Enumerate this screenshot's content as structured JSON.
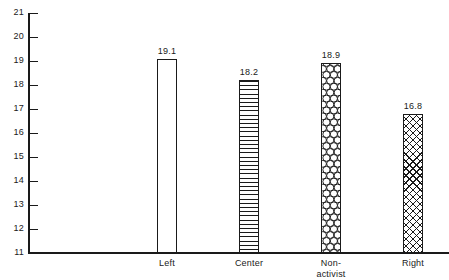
{
  "chart_data": {
    "type": "bar",
    "title": "",
    "subtitle": "",
    "xlabel": "",
    "ylabel": "",
    "categories": [
      "Left",
      "Center",
      "Non-activist",
      "Right"
    ],
    "values": [
      19.1,
      18.2,
      18.9,
      16.8
    ],
    "value_labels": [
      "19.1",
      "18.2",
      "18.9",
      "16.8"
    ],
    "bar_fills": [
      "empty",
      "horizontal-lines",
      "circles",
      "crosshatch"
    ],
    "ylim": [
      11,
      21
    ],
    "ytick_labels": [
      "11",
      "12",
      "13",
      "14",
      "15",
      "16",
      "17",
      "18",
      "19",
      "20",
      "21"
    ],
    "ytick_values": [
      11,
      12,
      13,
      14,
      15,
      16,
      17,
      18,
      19,
      20,
      21
    ],
    "grid": false,
    "legend": "none",
    "axis_color": "#1a1a1a",
    "background_color": "#ffffff"
  },
  "category_label_lines": [
    [
      "Left"
    ],
    [
      "Center"
    ],
    [
      "Non-",
      "activist"
    ],
    [
      "Right"
    ]
  ]
}
